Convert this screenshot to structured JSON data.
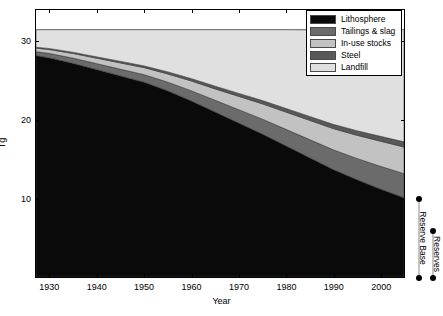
{
  "chart_data": {
    "type": "area",
    "title": "",
    "xlabel": "Year",
    "ylabel": "Tg",
    "xlim": [
      1927,
      2005
    ],
    "ylim": [
      0,
      34
    ],
    "xticks": [
      1930,
      1940,
      1950,
      1960,
      1970,
      1980,
      1990,
      2000
    ],
    "yticks": [
      10,
      20,
      30
    ],
    "grid": false,
    "legend_position": "top-right",
    "stacked": true,
    "x": [
      1927,
      1930,
      1935,
      1940,
      1945,
      1950,
      1955,
      1960,
      1965,
      1970,
      1975,
      1980,
      1985,
      1990,
      1995,
      2000,
      2005
    ],
    "series": [
      {
        "name": "Lithosphere",
        "color": "#0a0a0a",
        "values": [
          28.2,
          27.9,
          27.2,
          26.4,
          25.6,
          24.8,
          23.7,
          22.4,
          21.0,
          19.6,
          18.2,
          16.7,
          15.2,
          13.7,
          12.4,
          11.2,
          10.1
        ]
      },
      {
        "name": "Tailings & slag",
        "color": "#6b6b6b",
        "values": [
          0.5,
          0.55,
          0.65,
          0.75,
          0.85,
          0.95,
          1.1,
          1.3,
          1.5,
          1.7,
          1.9,
          2.1,
          2.3,
          2.5,
          2.7,
          2.9,
          3.05
        ]
      },
      {
        "name": "In-use stocks",
        "color": "#c2c2c2",
        "values": [
          0.45,
          0.5,
          0.6,
          0.7,
          0.8,
          0.9,
          1.05,
          1.25,
          1.45,
          1.7,
          1.95,
          2.2,
          2.45,
          2.7,
          2.95,
          3.2,
          3.4
        ]
      },
      {
        "name": "Steel",
        "color": "#585858",
        "values": [
          0.12,
          0.13,
          0.15,
          0.17,
          0.2,
          0.22,
          0.26,
          0.3,
          0.34,
          0.38,
          0.42,
          0.46,
          0.5,
          0.54,
          0.58,
          0.62,
          0.66
        ]
      },
      {
        "name": "Landfill",
        "color": "#e0e0e0",
        "values": [
          2.23,
          2.42,
          2.9,
          3.48,
          4.05,
          4.63,
          5.39,
          6.25,
          7.21,
          8.12,
          9.03,
          10.04,
          11.03,
          12.06,
          12.87,
          13.58,
          14.29
        ]
      }
    ],
    "total_line": 31.5,
    "annotations": [
      {
        "label": "Reserve Base",
        "top_value": 10.0,
        "bottom_value": 0.0,
        "x_value": 2008
      },
      {
        "label": "Reserves",
        "top_value": 6.0,
        "bottom_value": 0.0,
        "x_value": 2011
      }
    ]
  },
  "legend": {
    "items": [
      {
        "label": "Lithosphere"
      },
      {
        "label": "Tailings & slag"
      },
      {
        "label": "In-use stocks"
      },
      {
        "label": "Steel"
      },
      {
        "label": "Landfill"
      }
    ]
  },
  "axes": {
    "x_title": "Year",
    "y_title": "Tg",
    "x_tick_labels": [
      "1930",
      "1940",
      "1950",
      "1960",
      "1970",
      "1980",
      "1990",
      "2000"
    ],
    "y_tick_labels": [
      "10",
      "20",
      "30"
    ]
  }
}
